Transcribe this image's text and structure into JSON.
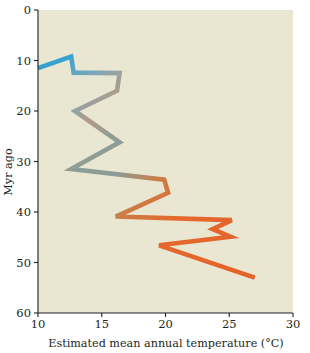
{
  "figure": {
    "background_color": "#ffffff",
    "plot_background_color": "#e9e7d2"
  },
  "chart_data": {
    "type": "line",
    "title": "",
    "subtitle": "",
    "xlabel": "Estimated mean annual temperature (°C)",
    "ylabel": "Myr ago",
    "xlim": [
      10,
      30
    ],
    "ylim": [
      0,
      60
    ],
    "y_inverted": true,
    "grid": false,
    "legend": "none",
    "xticks": [
      10,
      15,
      20,
      25,
      30
    ],
    "xtick_labels": [
      "10",
      "15",
      "20",
      "25",
      "30"
    ],
    "yticks": [
      0,
      10,
      20,
      30,
      40,
      50,
      60
    ],
    "ytick_labels": [
      "0",
      "10",
      "20",
      "30",
      "40",
      "50",
      "60"
    ],
    "series": [
      {
        "name": "Estimated mean annual temperature",
        "x_label": "temperature_c",
        "y_label": "age_myr",
        "gradient": {
          "start_color": "#2f9fd0",
          "mid_color": "#9a9f94",
          "end_color": "#e4612a",
          "direction": "along-series-from-young-to-old"
        },
        "points": [
          {
            "age_myr": 11.5,
            "temperature_c": 10.0
          },
          {
            "age_myr": 9.2,
            "temperature_c": 12.6
          },
          {
            "age_myr": 12.4,
            "temperature_c": 12.8
          },
          {
            "age_myr": 12.5,
            "temperature_c": 16.4
          },
          {
            "age_myr": 16.0,
            "temperature_c": 16.2
          },
          {
            "age_myr": 20.0,
            "temperature_c": 12.9
          },
          {
            "age_myr": 26.2,
            "temperature_c": 16.4
          },
          {
            "age_myr": 31.5,
            "temperature_c": 12.6
          },
          {
            "age_myr": 33.6,
            "temperature_c": 19.9
          },
          {
            "age_myr": 36.2,
            "temperature_c": 20.2
          },
          {
            "age_myr": 40.9,
            "temperature_c": 16.1
          },
          {
            "age_myr": 41.6,
            "temperature_c": 25.2
          },
          {
            "age_myr": 43.4,
            "temperature_c": 23.7
          },
          {
            "age_myr": 44.9,
            "temperature_c": 25.1
          },
          {
            "age_myr": 46.6,
            "temperature_c": 19.5
          },
          {
            "age_myr": 53.0,
            "temperature_c": 27.0
          }
        ]
      }
    ]
  }
}
